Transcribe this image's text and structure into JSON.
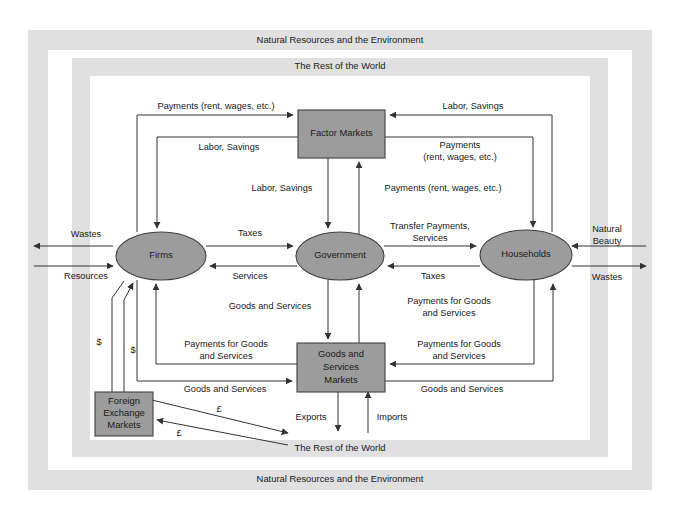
{
  "diagram": {
    "frames": [
      {
        "id": "environment",
        "label_top": "Natural Resources and the Environment",
        "label_bottom": "Natural Resources and the Environment",
        "color": "#e0e0e0"
      },
      {
        "id": "rest-of-world",
        "label_top": "The Rest of the World",
        "label_bottom": "The Rest of the World",
        "color": "#e0e0e0"
      }
    ],
    "nodes": [
      {
        "id": "factor-markets",
        "label": "Factor Markets",
        "shape": "rect",
        "fill": "#9c9c9c"
      },
      {
        "id": "firms",
        "label": "Firms",
        "shape": "ellipse",
        "fill": "#9c9c9c"
      },
      {
        "id": "government",
        "label": "Government",
        "shape": "ellipse",
        "fill": "#9c9c9c"
      },
      {
        "id": "households",
        "label": "Households",
        "shape": "ellipse",
        "fill": "#9c9c9c"
      },
      {
        "id": "goods-services-markets",
        "label": "Goods and\nServices\nMarkets",
        "label_line1": "Goods and",
        "label_line2": "Services",
        "label_line3": "Markets",
        "shape": "rect",
        "fill": "#9c9c9c"
      },
      {
        "id": "foreign-exchange-markets",
        "label": "Foreign\nExchange\nMarkets",
        "label_line1": "Foreign",
        "label_line2": "Exchange",
        "label_line3": "Markets",
        "shape": "rect",
        "fill": "#9c9c9c"
      }
    ],
    "flows": [
      {
        "id": "firms-to-factor-payments",
        "label": "Payments (rent, wages, etc.)",
        "from": "firms",
        "to": "factor-markets"
      },
      {
        "id": "factor-to-firms-labor",
        "label": "Labor, Savings",
        "from": "factor-markets",
        "to": "firms"
      },
      {
        "id": "households-to-factor-labor",
        "label": "Labor, Savings",
        "from": "households",
        "to": "factor-markets"
      },
      {
        "id": "factor-to-households-payments",
        "label_line1": "Payments",
        "label_line2": "(rent, wages, etc.)",
        "from": "factor-markets",
        "to": "households"
      },
      {
        "id": "factor-to-government-labor",
        "label": "Labor, Savings",
        "from": "factor-markets",
        "to": "government"
      },
      {
        "id": "government-to-factor-payments",
        "label": "Payments (rent, wages, etc.)",
        "from": "government",
        "to": "factor-markets"
      },
      {
        "id": "firms-to-government-taxes",
        "label": "Taxes",
        "from": "firms",
        "to": "government"
      },
      {
        "id": "government-to-firms-services",
        "label": "Services",
        "from": "government",
        "to": "firms"
      },
      {
        "id": "government-to-households-transfer",
        "label_line1": "Transfer Payments,",
        "label_line2": "Services",
        "from": "government",
        "to": "households"
      },
      {
        "id": "households-to-government-taxes",
        "label": "Taxes",
        "from": "households",
        "to": "government"
      },
      {
        "id": "government-to-goods-services",
        "label": "Goods and Services",
        "from": "government",
        "to": "goods-services-markets"
      },
      {
        "id": "goods-to-government-payments",
        "label_line1": "Payments for Goods",
        "label_line2": "and Services",
        "from": "goods-services-markets",
        "to": "government"
      },
      {
        "id": "goods-to-firms-payments",
        "label_line1": "Payments for Goods",
        "label_line2": "and Services",
        "from": "goods-services-markets",
        "to": "firms"
      },
      {
        "id": "households-to-goods-payments",
        "label_line1": "Payments for Goods",
        "label_line2": "and Services",
        "from": "households",
        "to": "goods-services-markets"
      },
      {
        "id": "firms-to-goods-services",
        "label": "Goods and Services",
        "from": "firms",
        "to": "goods-services-markets"
      },
      {
        "id": "goods-to-households-services",
        "label": "Goods and Services",
        "from": "goods-services-markets",
        "to": "households"
      },
      {
        "id": "wastes-firms",
        "label": "Wastes",
        "from": "firms",
        "to": "environment"
      },
      {
        "id": "resources-firms",
        "label": "Resources",
        "from": "environment",
        "to": "firms"
      },
      {
        "id": "natural-beauty-households",
        "label": "Natural\nBeauty",
        "label_line1": "Natural",
        "label_line2": "Beauty",
        "from": "environment",
        "to": "households"
      },
      {
        "id": "wastes-households",
        "label": "Wastes",
        "from": "households",
        "to": "environment"
      },
      {
        "id": "exports",
        "label": "Exports",
        "from": "goods-services-markets",
        "to": "rest-of-world"
      },
      {
        "id": "imports",
        "label": "Imports",
        "from": "rest-of-world",
        "to": "goods-services-markets"
      },
      {
        "id": "dollars-out-1",
        "label": "$",
        "from": "firms",
        "to": "foreign-exchange-markets"
      },
      {
        "id": "dollars-in-2",
        "label": "$",
        "from": "foreign-exchange-markets",
        "to": "firms"
      },
      {
        "id": "pounds-out",
        "label": "£",
        "from": "foreign-exchange-markets",
        "to": "rest-of-world"
      },
      {
        "id": "pounds-in",
        "label": "£",
        "from": "rest-of-world",
        "to": "foreign-exchange-markets"
      }
    ],
    "labels": {
      "environment_top": "Natural Resources and the Environment",
      "environment_bottom": "Natural Resources and the Environment",
      "world_top": "The Rest of the World",
      "world_bottom": "The Rest of the World",
      "factor_markets": "Factor Markets",
      "firms": "Firms",
      "government": "Government",
      "households": "Households",
      "goods_l1": "Goods and",
      "goods_l2": "Services",
      "goods_l3": "Markets",
      "fx_l1": "Foreign",
      "fx_l2": "Exchange",
      "fx_l3": "Markets",
      "payments_rent_wages_left": "Payments (rent, wages, etc.)",
      "labor_savings_left": "Labor, Savings",
      "labor_savings_right": "Labor, Savings",
      "payments_right_l1": "Payments",
      "payments_right_l2": "(rent, wages, etc.)",
      "labor_savings_center": "Labor, Savings",
      "payments_center": "Payments (rent, wages, etc.)",
      "taxes_left": "Taxes",
      "services_left": "Services",
      "transfer_l1": "Transfer Payments,",
      "transfer_l2": "Services",
      "taxes_right": "Taxes",
      "wastes_left": "Wastes",
      "resources_left": "Resources",
      "natural_beauty_l1": "Natural",
      "natural_beauty_l2": "Beauty",
      "wastes_right": "Wastes",
      "goods_and_services_center": "Goods and Services",
      "payments_goods_center_l1": "Payments for Goods",
      "payments_goods_center_l2": "and Services",
      "payments_goods_left_l1": "Payments for Goods",
      "payments_goods_left_l2": "and Services",
      "payments_goods_right_l1": "Payments for Goods",
      "payments_goods_right_l2": "and Services",
      "goods_services_lower_left": "Goods and Services",
      "goods_services_lower_right": "Goods and Services",
      "exports": "Exports",
      "imports": "Imports",
      "dollar_1": "$",
      "dollar_2": "$",
      "pound_1": "£",
      "pound_2": "£"
    }
  }
}
